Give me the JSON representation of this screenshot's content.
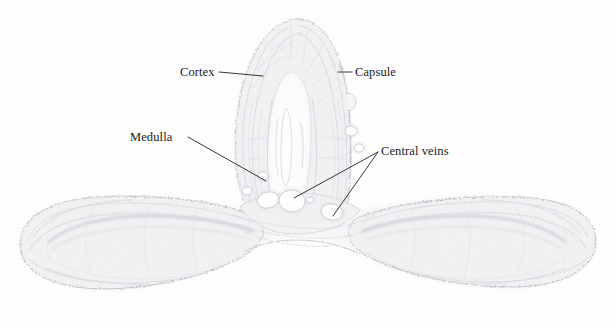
{
  "figure": {
    "kind": "histology-section-micrograph",
    "specimen": "Y-shaped glandular tissue section",
    "background_color": "#ffffff",
    "tissue_fill_color": "#f2f2f4",
    "tissue_edge_color": "#c9c9d0",
    "tissue_texture_color": "#d8d8de",
    "medulla_color": "#fafafc",
    "vessel_lumen_color": "#ffffff",
    "leader_line_color": "#2b2b2b",
    "label_text_color": "#1a1a1a"
  },
  "labels": {
    "cortex": "Cortex",
    "capsule": "Capsule",
    "medulla": "Medulla",
    "central_veins": "Central veins"
  },
  "leaders": {
    "cortex": {
      "x1": 219,
      "y1": 72,
      "x2": 263,
      "y2": 76
    },
    "capsule": {
      "x1": 338,
      "y1": 72,
      "x2": 352,
      "y2": 72
    },
    "medulla": {
      "x1": 188,
      "y1": 137,
      "x2": 266,
      "y2": 181
    },
    "central_veins_a": {
      "x1": 378,
      "y1": 152,
      "x2": 294,
      "y2": 198
    },
    "central_veins_b": {
      "x1": 378,
      "y1": 152,
      "x2": 333,
      "y2": 216
    }
  },
  "vessels": [
    {
      "name": "central-vein-1",
      "cx": 268,
      "cy": 200,
      "rx": 11,
      "ry": 8,
      "rot": -14
    },
    {
      "name": "central-vein-2",
      "cx": 292,
      "cy": 201,
      "rx": 13,
      "ry": 11,
      "rot": 8
    },
    {
      "name": "central-vein-3",
      "cx": 332,
      "cy": 212,
      "rx": 11,
      "ry": 8,
      "rot": 12
    },
    {
      "name": "central-vein-4",
      "cx": 247,
      "cy": 191,
      "rx": 5,
      "ry": 4,
      "rot": 0
    },
    {
      "name": "central-vein-5",
      "cx": 263,
      "cy": 176,
      "rx": 5,
      "ry": 4,
      "rot": 0
    },
    {
      "name": "central-vein-6",
      "cx": 351,
      "cy": 131,
      "rx": 6,
      "ry": 5,
      "rot": 0
    },
    {
      "name": "central-vein-7",
      "cx": 359,
      "cy": 148,
      "rx": 5,
      "ry": 4,
      "rot": 0
    },
    {
      "name": "central-vein-8",
      "cx": 310,
      "cy": 200,
      "rx": 4,
      "ry": 3,
      "rot": 0
    }
  ]
}
